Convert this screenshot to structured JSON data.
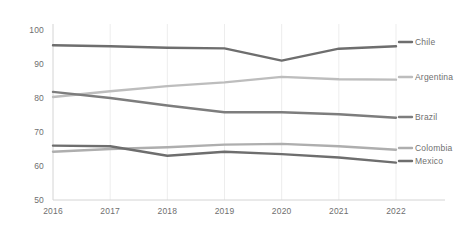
{
  "chart_data": {
    "type": "line",
    "title": "",
    "xlabel": "",
    "ylabel": "",
    "categories": [
      "2016",
      "2017",
      "2018",
      "2019",
      "2020",
      "2021",
      "2022"
    ],
    "x": [
      2016,
      2017,
      2018,
      2019,
      2020,
      2021,
      2022
    ],
    "ylim": [
      50,
      100
    ],
    "yticks": [
      "50",
      "60",
      "70",
      "80",
      "90",
      "100"
    ],
    "ytick_values": [
      50,
      60,
      70,
      80,
      90,
      100
    ],
    "grid": true,
    "legend_position": "right-inline-labels",
    "series": [
      {
        "name": "Chile",
        "color": "#6e6e6e",
        "values": [
          95.5,
          95.2,
          94.8,
          94.6,
          91.0,
          94.5,
          95.2
        ]
      },
      {
        "name": "Argentina",
        "color": "#bdbdbd",
        "values": [
          80.3,
          82.0,
          83.5,
          84.6,
          86.2,
          85.5,
          85.4
        ]
      },
      {
        "name": "Brazil",
        "color": "#7d7d7d",
        "values": [
          81.8,
          80.0,
          77.8,
          75.8,
          75.8,
          75.2,
          74.2
        ]
      },
      {
        "name": "Colombia",
        "color": "#aeaeae",
        "values": [
          64.2,
          65.0,
          65.5,
          66.3,
          66.5,
          65.8,
          64.8
        ]
      },
      {
        "name": "Mexico",
        "color": "#6e6e6e",
        "values": [
          66.0,
          65.8,
          63.0,
          64.2,
          63.5,
          62.5,
          61.0
        ]
      }
    ]
  },
  "axes": {
    "y_axis_line_color": "#d4d4d4",
    "x_axis_line_color": "#d4d4d4",
    "gridline_color": "#ededed",
    "tick_label_color": "#6f6f6f"
  }
}
